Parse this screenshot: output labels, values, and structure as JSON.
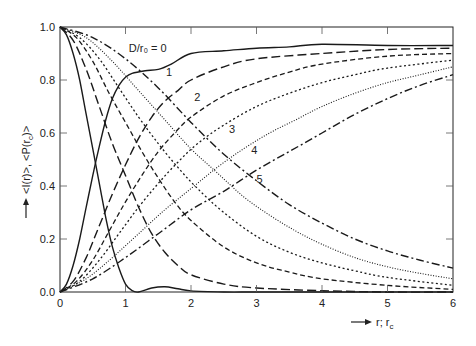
{
  "chart_data": {
    "type": "line",
    "title": "",
    "xlabel": "r; r_c",
    "ylabel": "<I(r)>, <P(r_c)>",
    "xlim": [
      0,
      6
    ],
    "ylim": [
      0,
      1.0
    ],
    "grid": false,
    "x_ticks": [
      "0",
      "1",
      "2",
      "3",
      "4",
      "5",
      "6"
    ],
    "y_ticks": [
      "0.0",
      "0.2",
      "0.4",
      "0.6",
      "0.8",
      "1.0"
    ],
    "legend": "inline curve labels",
    "curve_labels": [
      {
        "text": "D/r₀ = 0",
        "x": 1.05,
        "y": 0.905
      },
      {
        "text": "1",
        "x": 1.62,
        "y": 0.815
      },
      {
        "text": "2",
        "x": 2.05,
        "y": 0.72
      },
      {
        "text": "3",
        "x": 2.58,
        "y": 0.6
      },
      {
        "text": "4",
        "x": 2.92,
        "y": 0.52
      },
      {
        "text": "5",
        "x": 3.0,
        "y": 0.41
      }
    ],
    "series": [
      {
        "name": "<I(r)> D/r0=0",
        "style": "solid",
        "x": [
          0,
          0.1,
          0.2,
          0.3,
          0.4,
          0.5,
          0.6,
          0.7,
          0.8,
          0.9,
          1.0,
          1.1,
          1.2,
          1.4,
          1.6,
          1.8,
          2.0,
          2.5,
          3,
          4,
          5,
          6
        ],
        "y": [
          1.0,
          0.97,
          0.9,
          0.8,
          0.67,
          0.54,
          0.41,
          0.28,
          0.17,
          0.09,
          0.03,
          0.005,
          0.0,
          0.015,
          0.02,
          0.012,
          0.004,
          0.0,
          0.0,
          0.0,
          0.0,
          0.0
        ]
      },
      {
        "name": "<I(r)> D/r0=1",
        "style": "longdash",
        "x": [
          0,
          0.2,
          0.4,
          0.6,
          0.8,
          1.0,
          1.2,
          1.4,
          1.6,
          1.8,
          2.0,
          2.5,
          3,
          4,
          5,
          6
        ],
        "y": [
          1.0,
          0.95,
          0.84,
          0.7,
          0.56,
          0.44,
          0.32,
          0.22,
          0.15,
          0.1,
          0.065,
          0.03,
          0.015,
          0.005,
          0.0,
          0.0
        ]
      },
      {
        "name": "<I(r)> D/r0=2",
        "style": "dash",
        "x": [
          0,
          0.25,
          0.5,
          0.75,
          1.0,
          1.25,
          1.5,
          1.75,
          2.0,
          2.5,
          3,
          3.5,
          4,
          5,
          6
        ],
        "y": [
          1.0,
          0.96,
          0.87,
          0.75,
          0.64,
          0.53,
          0.43,
          0.34,
          0.27,
          0.17,
          0.11,
          0.075,
          0.05,
          0.025,
          0.01
        ]
      },
      {
        "name": "<I(r)> D/r0=3",
        "style": "dot",
        "x": [
          0,
          0.3,
          0.6,
          0.9,
          1.2,
          1.5,
          1.8,
          2.1,
          2.5,
          3,
          3.5,
          4,
          4.5,
          5,
          6
        ],
        "y": [
          1.0,
          0.96,
          0.88,
          0.77,
          0.66,
          0.56,
          0.47,
          0.39,
          0.3,
          0.21,
          0.15,
          0.11,
          0.08,
          0.055,
          0.025
        ]
      },
      {
        "name": "<I(r)> D/r0=4",
        "style": "finedot",
        "x": [
          0,
          0.4,
          0.8,
          1.2,
          1.6,
          2.0,
          2.4,
          2.8,
          3.2,
          3.6,
          4.0,
          4.5,
          5,
          5.5,
          6
        ],
        "y": [
          1.0,
          0.96,
          0.87,
          0.76,
          0.65,
          0.54,
          0.45,
          0.36,
          0.29,
          0.23,
          0.18,
          0.13,
          0.095,
          0.07,
          0.05
        ]
      },
      {
        "name": "<I(r)> D/r0=5",
        "style": "dashdot",
        "x": [
          0,
          0.5,
          1.0,
          1.5,
          2.0,
          2.5,
          3.0,
          3.5,
          4.0,
          4.5,
          5.0,
          5.5,
          6
        ],
        "y": [
          1.0,
          0.96,
          0.88,
          0.77,
          0.64,
          0.52,
          0.42,
          0.33,
          0.26,
          0.2,
          0.155,
          0.12,
          0.09
        ]
      },
      {
        "name": "<P(r_c)> D/r0=0",
        "style": "solid",
        "x": [
          0,
          0.1,
          0.2,
          0.3,
          0.4,
          0.5,
          0.6,
          0.7,
          0.8,
          0.9,
          1.0,
          1.1,
          1.3,
          1.5,
          1.7,
          2.0,
          2.5,
          3,
          3.5,
          4,
          5,
          6
        ],
        "y": [
          0.0,
          0.03,
          0.1,
          0.2,
          0.32,
          0.44,
          0.55,
          0.65,
          0.73,
          0.78,
          0.81,
          0.825,
          0.835,
          0.84,
          0.86,
          0.9,
          0.91,
          0.92,
          0.925,
          0.935,
          0.93,
          0.93
        ]
      },
      {
        "name": "<P(r_c)> D/r0=1",
        "style": "longdash",
        "x": [
          0,
          0.2,
          0.4,
          0.6,
          0.8,
          1.0,
          1.2,
          1.4,
          1.6,
          1.8,
          2.0,
          2.5,
          3,
          4,
          5,
          6
        ],
        "y": [
          0.0,
          0.04,
          0.13,
          0.25,
          0.37,
          0.48,
          0.58,
          0.66,
          0.72,
          0.76,
          0.8,
          0.85,
          0.88,
          0.9,
          0.915,
          0.92
        ]
      },
      {
        "name": "<P(r_c)> D/r0=2",
        "style": "dash",
        "x": [
          0,
          0.25,
          0.5,
          0.75,
          1.0,
          1.25,
          1.5,
          1.75,
          2.0,
          2.5,
          3,
          3.5,
          4,
          5,
          6
        ],
        "y": [
          0.0,
          0.04,
          0.12,
          0.23,
          0.34,
          0.44,
          0.53,
          0.6,
          0.66,
          0.74,
          0.79,
          0.83,
          0.86,
          0.89,
          0.9
        ]
      },
      {
        "name": "<P(r_c)> D/r0=3",
        "style": "dot",
        "x": [
          0,
          0.3,
          0.6,
          0.9,
          1.2,
          1.5,
          1.8,
          2.1,
          2.5,
          3,
          3.5,
          4,
          4.5,
          5,
          6
        ],
        "y": [
          0.0,
          0.04,
          0.12,
          0.22,
          0.32,
          0.41,
          0.49,
          0.56,
          0.63,
          0.7,
          0.75,
          0.79,
          0.82,
          0.845,
          0.875
        ]
      },
      {
        "name": "<P(r_c)> D/r0=4",
        "style": "finedot",
        "x": [
          0,
          0.4,
          0.8,
          1.2,
          1.6,
          2.0,
          2.4,
          2.8,
          3.2,
          3.6,
          4.0,
          4.5,
          5,
          5.5,
          6
        ],
        "y": [
          0.0,
          0.05,
          0.13,
          0.22,
          0.31,
          0.39,
          0.47,
          0.54,
          0.6,
          0.65,
          0.7,
          0.75,
          0.79,
          0.82,
          0.85
        ]
      },
      {
        "name": "<P(r_c)> D/r0=5",
        "style": "dashdot",
        "x": [
          0,
          0.5,
          1.0,
          1.5,
          2.0,
          2.5,
          3.0,
          3.5,
          4.0,
          4.5,
          5.0,
          5.5,
          6
        ],
        "y": [
          0.0,
          0.05,
          0.13,
          0.22,
          0.31,
          0.38,
          0.46,
          0.53,
          0.6,
          0.67,
          0.73,
          0.78,
          0.82
        ]
      }
    ]
  },
  "axes": {
    "x_label_prefix": "r; r",
    "x_label_sub": "c",
    "y_label": "<I(r)>, <P(r",
    "y_label_sub": "c",
    "y_label_end": ")>"
  }
}
